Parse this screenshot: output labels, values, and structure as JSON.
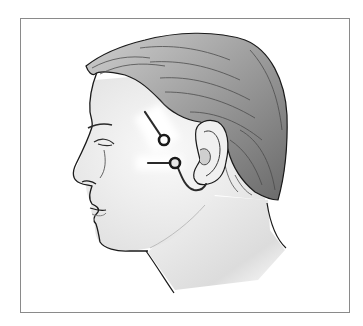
{
  "figure": {
    "caption": "Head profile with electrode placement near the ear",
    "colors": {
      "background": "#ffffff",
      "frame_border": "#8a8a8a",
      "skin": "#f2f2f2",
      "skin_shadow": "#d6d6d6",
      "hair": "#9a9a9a",
      "hair_dark": "#555555",
      "outline": "#1a1a1a",
      "highlight": "#ffffff"
    },
    "markers": [
      {
        "id": "electrode-upper",
        "location": "temple, in front of upper ear",
        "lead_direction": "diagonal from upper-left",
        "center": [
          164,
          140
        ],
        "radius": 5
      },
      {
        "id": "electrode-lower",
        "location": "in front of tragus / cheek",
        "lead_direction": "horizontal from left, wire curving under earlobe",
        "center": [
          175,
          163
        ],
        "radius": 5
      }
    ]
  }
}
